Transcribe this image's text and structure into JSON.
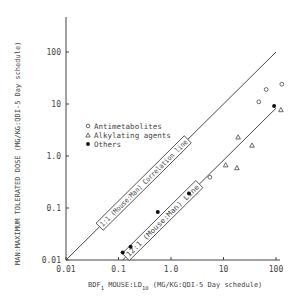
{
  "chart_data": {
    "type": "scatter",
    "title": "",
    "xlabel": "BDF1 MOUSE:LD10 (MG/KG:QDI-5 Day schedule)",
    "xlabel_parts": {
      "main": "BDF",
      "sub1": "1",
      "mid": " MOUSE:LD",
      "sub2": "10",
      "tail": " (MG/KG:QDI-5 Day schedule)"
    },
    "ylabel": "MAN:MAXIMUM TOLERATED DOSE (MG/KG:QDI-5 Day schedule)",
    "xscale": "log",
    "yscale": "log",
    "xlim": [
      0.01,
      100
    ],
    "ylim": [
      0.01,
      100
    ],
    "x_ticks": [
      "0.01",
      "0.1",
      "1.0",
      "10",
      "100"
    ],
    "y_ticks": [
      "0.01",
      "0.1",
      "1.0",
      "10",
      "100"
    ],
    "grid": false,
    "legend_position": "upper-left (inside plot)",
    "legend": [
      {
        "name": "Antimetabolites",
        "marker": "open-circle"
      },
      {
        "name": "Alkylating agents",
        "marker": "open-triangle"
      },
      {
        "name": "Others",
        "marker": "filled-circle"
      }
    ],
    "series": [
      {
        "name": "Antimetabolites",
        "marker": "open-circle",
        "points": [
          [
            5.5,
            0.39
          ],
          [
            47,
            11
          ],
          [
            65,
            19
          ],
          [
            129,
            24
          ]
        ]
      },
      {
        "name": "Alkylating agents",
        "marker": "open-triangle",
        "points": [
          [
            11,
            0.67
          ],
          [
            18,
            0.59
          ],
          [
            19,
            2.3
          ],
          [
            35,
            1.6
          ],
          [
            124,
            7.7
          ]
        ]
      },
      {
        "name": "Others",
        "marker": "filled-circle",
        "points": [
          [
            0.12,
            0.014
          ],
          [
            0.17,
            0.018
          ],
          [
            0.56,
            0.084
          ],
          [
            2.2,
            0.19
          ],
          [
            92,
            9.2
          ]
        ]
      }
    ],
    "reference_lines": [
      {
        "label": "1:1 (Mouse:Man) Correlation line",
        "ratio": 1,
        "from": [
          0.01,
          0.01
        ],
        "to": [
          100,
          100
        ]
      },
      {
        "label": "12:1 (Mouse:Man) Line",
        "ratio": 12,
        "from": [
          0.12,
          0.01
        ],
        "to": [
          100,
          8.3
        ]
      }
    ]
  }
}
